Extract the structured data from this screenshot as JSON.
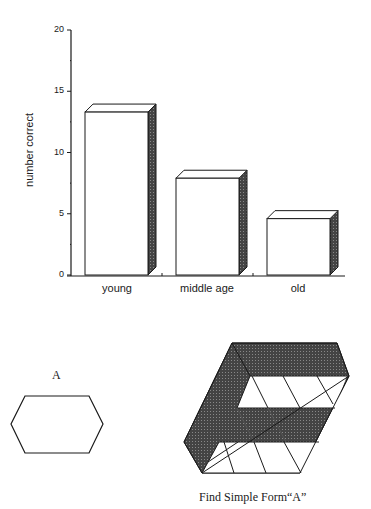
{
  "chart_data": {
    "type": "bar",
    "style": "3d-bar",
    "title": "",
    "xlabel": "",
    "ylabel": "number correct",
    "categories": [
      "young",
      "middle age",
      "old"
    ],
    "values": [
      13.3,
      7.9,
      4.6
    ],
    "ylim": [
      0,
      20
    ],
    "yticks": [
      0,
      5,
      10,
      15,
      20
    ],
    "grid": false,
    "legend": null
  },
  "figure": {
    "simple_form_label": "A",
    "caption": "Find Simple Form“A”"
  },
  "colors": {
    "ink": "#1a1a1a",
    "bar_face": "#ffffff",
    "bar_side": "#3a3a3a",
    "figure_fill": "#222222"
  }
}
